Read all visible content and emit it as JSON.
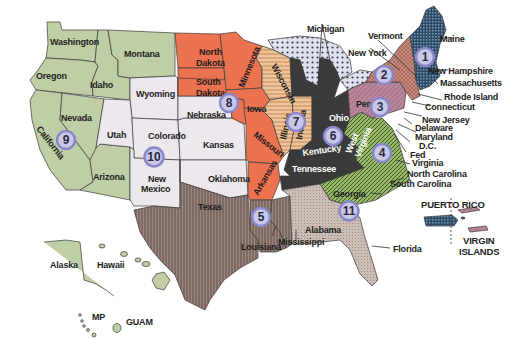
{
  "map": {
    "title": "Federal Reserve Districts",
    "colors": {
      "d1": "#2d4a66",
      "d2": "#c98b7d",
      "d3": "#b37f90",
      "d4": "#8aa55e",
      "d5": "#8a7770",
      "d6": "#3a3a3a",
      "d7": "#e8b88c",
      "d8": "#ec7350",
      "d9": "#b8c8a0",
      "d10": "#ece8ee",
      "d11": "#c8bcb4",
      "d12": "#bccca2",
      "great_lakes": "#c8cde0"
    },
    "districts": [
      {
        "number": "1",
        "label": "1"
      },
      {
        "number": "2",
        "label": "2"
      },
      {
        "number": "3",
        "label": "3"
      },
      {
        "number": "4",
        "label": "4"
      },
      {
        "number": "5",
        "label": "5"
      },
      {
        "number": "6",
        "label": "6"
      },
      {
        "number": "7",
        "label": "7"
      },
      {
        "number": "8",
        "label": "8"
      },
      {
        "number": "9",
        "label": "9"
      },
      {
        "number": "10",
        "label": "10"
      },
      {
        "number": "11",
        "label": "11"
      }
    ],
    "state_labels": {
      "washington": "Washington",
      "oregon": "Oregon",
      "idaho": "Idaho",
      "montana": "Montana",
      "wyoming": "Wyoming",
      "nevada": "Nevada",
      "california": "California",
      "utah": "Utah",
      "colorado": "Colorado",
      "arizona": "Arizona",
      "new_mexico_1": "New",
      "new_mexico_2": "Mexico",
      "north_dakota_1": "North",
      "north_dakota_2": "Dakota",
      "south_dakota_1": "South",
      "south_dakota_2": "Dakota",
      "nebraska": "Nebraska",
      "kansas": "Kansas",
      "oklahoma": "Oklahoma",
      "texas": "Texas",
      "minnesota": "Minnesota",
      "iowa": "Iowa",
      "missouri": "Missouri",
      "arkansas": "Arkansas",
      "louisiana": "Louisiana",
      "mississippi": "Mississippi",
      "alabama": "Alabama",
      "georgia": "Georgia",
      "florida": "Florida",
      "tennessee": "Tennessee",
      "kentucky": "Kentucky",
      "ohio": "Ohio",
      "indiana": "Indiana",
      "illinois": "Illinois",
      "wisconsin": "Wisconsin",
      "michigan": "Michigan",
      "west_virginia_1": "West",
      "west_virginia_2": "Virginia",
      "virginia": "Virginia",
      "north_carolina": "North Carolina",
      "south_carolina": "South Carolina",
      "pennsylvania": "Penn",
      "new_york": "New York",
      "vermont": "Vermont",
      "maine": "Maine",
      "new_hampshire": "New Hampshire",
      "massachusetts": "Massachusetts",
      "rhode_island": "Rhode Island",
      "connecticut": "Connecticut",
      "new_jersey": "New Jersey",
      "delaware": "Delaware",
      "maryland": "Maryland",
      "dc": "D.C.",
      "fed": "Fed",
      "alaska": "Alaska",
      "hawaii": "Hawaii",
      "mp": "MP",
      "guam": "GUAM",
      "puerto_rico": "PUERTO RICO",
      "virgin_islands_1": "VIRGIN",
      "virgin_islands_2": "ISLANDS"
    }
  }
}
